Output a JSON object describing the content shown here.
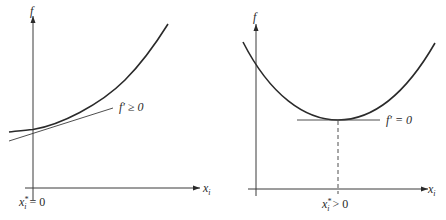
{
  "figure": {
    "left_panel": {
      "y_axis_label": "f",
      "x_axis_label_main": "x",
      "x_axis_label_sub": "i",
      "tangent_label": "f′ ≥ 0",
      "origin_label_main": "x",
      "origin_label_sup": "*",
      "origin_label_sub": "i",
      "origin_label_rest": " = 0"
    },
    "right_panel": {
      "y_axis_label": "f",
      "x_axis_label_main": "x",
      "x_axis_label_sub": "i",
      "tangent_label": "f′ = 0",
      "min_label_main": "x",
      "min_label_sup": "*",
      "min_label_sub": "i",
      "min_label_rest": " > 0"
    },
    "colors": {
      "line": "#2a2a2a",
      "background": "#ffffff"
    }
  }
}
